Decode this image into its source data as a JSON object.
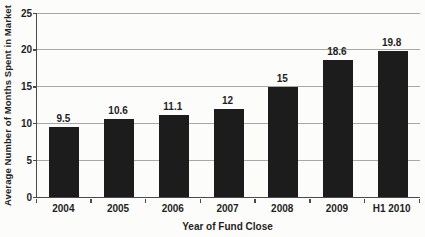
{
  "chart_data": {
    "type": "bar",
    "title": "",
    "categories": [
      "2004",
      "2005",
      "2006",
      "2007",
      "2008",
      "2009",
      "H1 2010"
    ],
    "values": [
      9.5,
      10.6,
      11.1,
      12,
      15,
      18.6,
      19.8
    ],
    "value_labels": [
      "9.5",
      "10.6",
      "11.1",
      "12",
      "15",
      "18.6",
      "19.8"
    ],
    "xlabel": "Year of Fund Close",
    "ylabel": "Average Number of Months Spent in Market",
    "ylim": [
      0,
      25
    ],
    "yticks": [
      0,
      5,
      10,
      15,
      20,
      25
    ],
    "grid": "horizontal gridlines on",
    "legend_position": "none",
    "colors": {
      "bar": "#1c1c1c",
      "gridline": "#a8a8a8",
      "axis": "#4a4a4a",
      "text": "#1f1f1f",
      "background": "#fcfcfa"
    }
  }
}
